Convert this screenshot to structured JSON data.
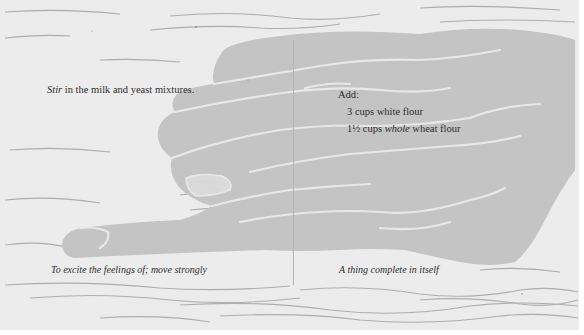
{
  "page": {
    "colors": {
      "paper": "#ececec",
      "hand_fill": "#c4c4c4",
      "hand_highlight": "#e8e8e8",
      "grain": "#8e8e8e",
      "text": "#2e2e2e",
      "gutter": "#b4b4b4"
    }
  },
  "left_page": {
    "instruction": {
      "emphasis": "Stir",
      "rest": " in the milk and yeast mixtures."
    },
    "caption": "To excite the feelings of; move strongly"
  },
  "right_page": {
    "heading": "Add:",
    "ingredients": [
      {
        "qty": "3 cups",
        "pre": " white flour",
        "emphasis": "",
        "post": ""
      },
      {
        "qty": "1½ cups",
        "pre": " ",
        "emphasis": "whole",
        "post": " wheat flour"
      }
    ],
    "caption": "A thing complete in itself"
  },
  "illustration": {
    "subject": "hand-linocut-icon",
    "background": "wood-grain"
  }
}
